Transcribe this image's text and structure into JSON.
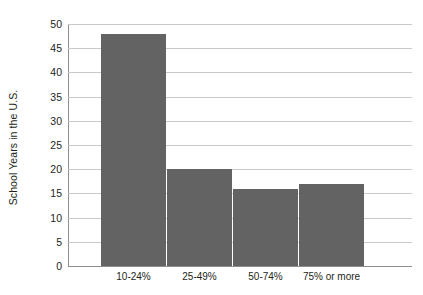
{
  "chart_data": {
    "type": "bar",
    "title": "",
    "xlabel": "",
    "ylabel": "School Years in the U.S.",
    "categories": [
      "10-24%",
      "25-49%",
      "50-74%",
      "75% or more"
    ],
    "values": [
      48,
      20,
      16,
      17
    ],
    "ylim": [
      0,
      50
    ],
    "yticks": [
      0,
      5,
      10,
      15,
      20,
      25,
      30,
      35,
      40,
      45,
      50
    ],
    "ytick_labels": [
      "0",
      "5",
      "10",
      "15",
      "20",
      "25",
      "30",
      "35",
      "40",
      "45",
      "50"
    ],
    "grid": true,
    "legend": false,
    "legend_position": "none",
    "bar_color": "#636363",
    "grid_color": "#c9c9c9",
    "axis_color": "#8d8d8d",
    "background_color": "#ffffff",
    "text_color": "#231f20"
  }
}
